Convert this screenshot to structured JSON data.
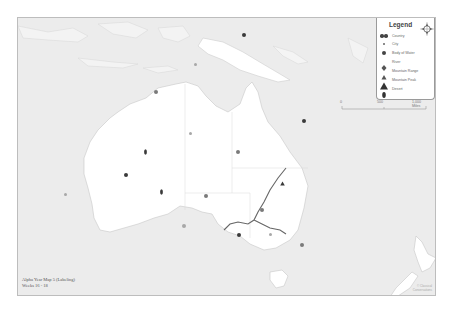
{
  "map": {
    "title": "Alpha Year Map 5 (Labeling)",
    "subtitle": "Weeks 16 - 18",
    "region": "Australia and Oceania",
    "colors": {
      "ocean": "#ececec",
      "land_focus": "#ffffff",
      "land_other": "#f4f4f4",
      "border": "#bdbdbd",
      "river": "#666666",
      "marker_dark": "#3a3a3a",
      "marker_medium": "#7a7a7a",
      "marker_light": "#a8a8a8"
    }
  },
  "legend": {
    "title": "Legend",
    "items": [
      {
        "symbol": "double-dot",
        "label": "Country"
      },
      {
        "symbol": "small-dot",
        "label": "City"
      },
      {
        "symbol": "square-dot",
        "label": "Body of Water"
      },
      {
        "symbol": "diamond",
        "label": "River"
      },
      {
        "symbol": "triangle-small",
        "label": "Mountain Range"
      },
      {
        "symbol": "triangle-large",
        "label": "Mountain Peak"
      },
      {
        "symbol": "teardrop",
        "label": "Desert"
      }
    ],
    "compass": {
      "n": "N",
      "s": "S",
      "e": "E",
      "w": "W"
    }
  },
  "scale": {
    "labels": [
      "0",
      "500",
      "1,000 Miles"
    ]
  },
  "credit": {
    "line1": "© Classical",
    "line2": "Conversations"
  },
  "markers": [
    {
      "type": "body-of-water",
      "x": 226,
      "y": 17,
      "shade": "dark"
    },
    {
      "type": "city",
      "x": 177,
      "y": 46,
      "shade": "light"
    },
    {
      "type": "body-of-water",
      "x": 138,
      "y": 74,
      "shade": "medium"
    },
    {
      "type": "body-of-water",
      "x": 286,
      "y": 103,
      "shade": "dark"
    },
    {
      "type": "city",
      "x": 172,
      "y": 115,
      "shade": "light"
    },
    {
      "type": "desert",
      "x": 127,
      "y": 126,
      "shade": "dark"
    },
    {
      "type": "body-of-water",
      "x": 220,
      "y": 134,
      "shade": "medium"
    },
    {
      "type": "body-of-water",
      "x": 108,
      "y": 157,
      "shade": "dark"
    },
    {
      "type": "mountain-range",
      "x": 264,
      "y": 156,
      "shade": "dark"
    },
    {
      "type": "desert",
      "x": 143,
      "y": 166,
      "shade": "dark"
    },
    {
      "type": "body-of-water",
      "x": 188,
      "y": 178,
      "shade": "medium"
    },
    {
      "type": "body-of-water",
      "x": 244,
      "y": 192,
      "shade": "medium"
    },
    {
      "type": "body-of-water",
      "x": 166,
      "y": 208,
      "shade": "light"
    },
    {
      "type": "body-of-water",
      "x": 221,
      "y": 217,
      "shade": "dark"
    },
    {
      "type": "body-of-water",
      "x": 284,
      "y": 227,
      "shade": "medium"
    },
    {
      "type": "city",
      "x": 252,
      "y": 216,
      "shade": "light"
    },
    {
      "type": "city",
      "x": 47,
      "y": 176,
      "shade": "light"
    }
  ]
}
